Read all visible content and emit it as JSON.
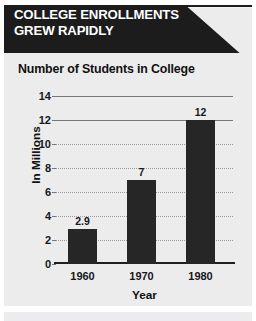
{
  "banner": {
    "line1": "COLLEGE ENROLLMENTS",
    "line2": "GREW RAPIDLY",
    "background_color": "#1c1c1c",
    "text_color": "#ffffff"
  },
  "panel": {
    "background_color": "#ececed"
  },
  "chart_data": {
    "type": "bar",
    "title": "Number of Students in College",
    "xlabel": "Year",
    "ylabel": "In Millions",
    "categories": [
      "1960",
      "1970",
      "1980"
    ],
    "values": [
      2.9,
      7,
      12
    ],
    "value_labels": [
      "2.9",
      "7",
      "12"
    ],
    "ylim": [
      0,
      14
    ],
    "ytick_labels": [
      "0",
      "2",
      "4",
      "6",
      "8",
      "10",
      "12",
      "14"
    ],
    "ytick_values": [
      0,
      2,
      4,
      6,
      8,
      10,
      12,
      14
    ],
    "grid": true,
    "legend": false,
    "bar_color": "#262626",
    "grid_color": "#9b9b9d",
    "axis_color": "#1f1f1f"
  }
}
